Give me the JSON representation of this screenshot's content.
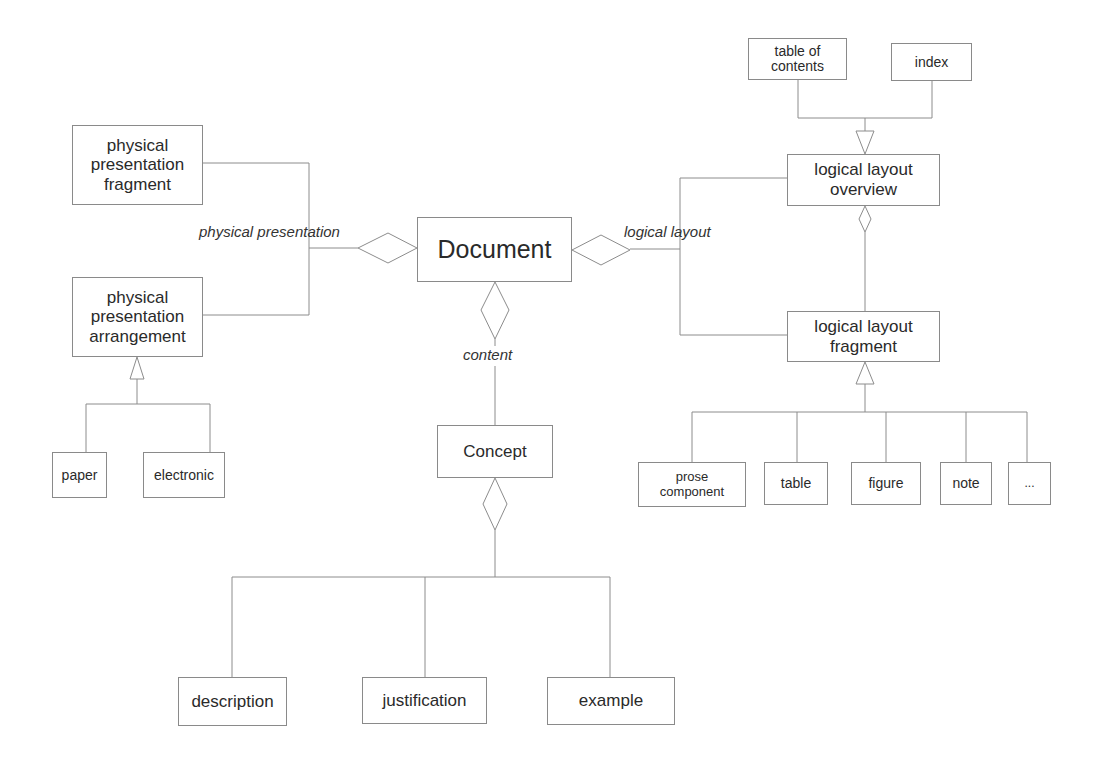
{
  "diagram": {
    "central": "Document",
    "relations": {
      "physical": "physical presentation",
      "logical": "logical layout",
      "content": "content"
    },
    "physical": {
      "fragment": "physical presentation fragment",
      "arrangement": "physical presentation arrangement",
      "fragment_lines": [
        "physical",
        "presentation",
        "fragment"
      ],
      "arrangement_lines": [
        "physical",
        "presentation",
        "arrangement"
      ],
      "subtypes": [
        "paper",
        "electronic"
      ]
    },
    "logical": {
      "overview_lines": [
        "logical layout",
        "overview"
      ],
      "fragment_lines": [
        "logical layout",
        "fragment"
      ],
      "overview_parts": [
        [
          "table of",
          "contents"
        ],
        [
          "index"
        ]
      ],
      "fragment_subtypes": [
        [
          "prose",
          "component"
        ],
        [
          "table"
        ],
        [
          "figure"
        ],
        [
          "note"
        ],
        [
          "..."
        ]
      ]
    },
    "content": {
      "concept": "Concept",
      "parts": [
        "description",
        "justification",
        "example"
      ]
    }
  }
}
